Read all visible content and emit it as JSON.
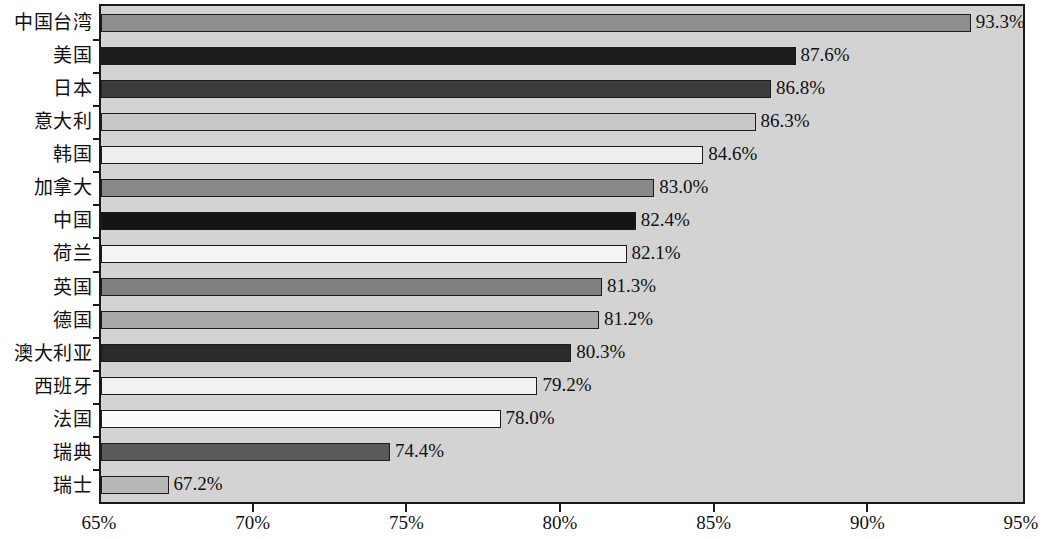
{
  "chart_data": {
    "type": "bar",
    "orientation": "horizontal",
    "title": "",
    "subtitle": "",
    "xlabel": "",
    "ylabel": "",
    "xlim": [
      65,
      95
    ],
    "xtick_step": 5,
    "xticks": [
      65,
      70,
      75,
      80,
      85,
      90,
      95
    ],
    "xtick_labels": [
      "65%",
      "70%",
      "75%",
      "80%",
      "85%",
      "90%",
      "95%"
    ],
    "grid": false,
    "legend": false,
    "value_suffix": "%",
    "categories": [
      "中国台湾",
      "美国",
      "日本",
      "意大利",
      "韩国",
      "加拿大",
      "中国",
      "荷兰",
      "英国",
      "德国",
      "澳大利亚",
      "西班牙",
      "法国",
      "瑞典",
      "瑞士"
    ],
    "values": [
      93.3,
      87.6,
      86.8,
      86.3,
      84.6,
      83.0,
      82.4,
      82.1,
      81.3,
      81.2,
      80.3,
      79.2,
      78.0,
      74.4,
      67.2
    ],
    "value_labels": [
      "93.3%",
      "87.6%",
      "86.8%",
      "86.3%",
      "84.6%",
      "83.0%",
      "82.4%",
      "82.1%",
      "81.3%",
      "81.2%",
      "80.3%",
      "79.2%",
      "78.0%",
      "74.4%",
      "67.2%"
    ],
    "bar_colors": [
      "#8e8e8e",
      "#1d1d1d",
      "#3d3d3d",
      "#c8c8c8",
      "#eeeeee",
      "#888888",
      "#141414",
      "#f4f4f4",
      "#808080",
      "#a8a8a8",
      "#2a2a2a",
      "#f2f2f2",
      "#fafafa",
      "#5a5a5a",
      "#b8b8b8"
    ],
    "bar_edge_color": "#1c1c1c",
    "plot_background": "#d3d3d3",
    "figure_background": "#ffffff",
    "text_color": "#111111"
  }
}
